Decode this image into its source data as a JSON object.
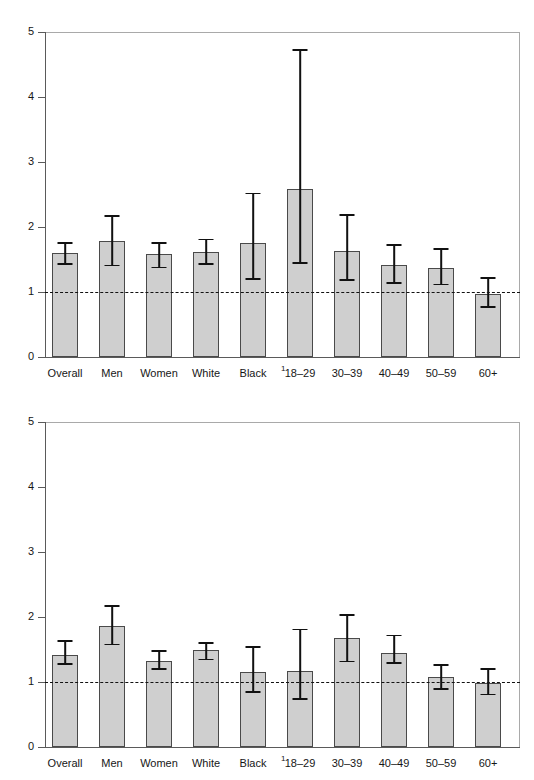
{
  "chart_data": [
    {
      "id": "top",
      "type": "bar",
      "title": "",
      "xlabel": "",
      "ylabel": "",
      "ylim": [
        0,
        5
      ],
      "yticks": [
        "0",
        "1",
        "2",
        "3",
        "4",
        "5"
      ],
      "grid": false,
      "legend": "none",
      "reference_line": 1,
      "error_bars": true,
      "footnote_marker": "1",
      "footnote_after_category": "Black",
      "categories": [
        "Overall",
        "Men",
        "Women",
        "White",
        "Black",
        "18–29",
        "30–39",
        "40–49",
        "50–59",
        "60+"
      ],
      "values": [
        1.6,
        1.78,
        1.58,
        1.62,
        1.76,
        2.58,
        1.63,
        1.41,
        1.37,
        0.97
      ],
      "ci_low": [
        1.45,
        1.42,
        1.39,
        1.45,
        1.21,
        1.46,
        1.2,
        1.15,
        1.13,
        0.78
      ],
      "ci_high": [
        1.77,
        2.18,
        1.77,
        1.82,
        2.53,
        4.74,
        2.2,
        1.74,
        1.68,
        1.23
      ]
    },
    {
      "id": "bottom",
      "type": "bar",
      "title": "",
      "xlabel": "",
      "ylabel": "",
      "ylim": [
        0,
        5
      ],
      "yticks": [
        "0",
        "1",
        "2",
        "3",
        "4",
        "5"
      ],
      "grid": false,
      "legend": "none",
      "reference_line": 1,
      "error_bars": true,
      "footnote_marker": "1",
      "footnote_after_category": "Black",
      "categories": [
        "Overall",
        "Men",
        "Women",
        "White",
        "Black",
        "18–29",
        "30–39",
        "40–49",
        "50–59",
        "60+"
      ],
      "values": [
        1.41,
        1.86,
        1.33,
        1.49,
        1.16,
        1.17,
        1.68,
        1.45,
        1.08,
        0.98
      ],
      "ci_low": [
        1.29,
        1.59,
        1.21,
        1.36,
        0.86,
        0.75,
        1.33,
        1.31,
        0.91,
        0.82
      ],
      "ci_high": [
        1.65,
        2.18,
        1.49,
        1.61,
        1.55,
        1.82,
        2.04,
        1.73,
        1.28,
        1.21
      ]
    }
  ],
  "colors": {
    "bar_fill": "#cfcfcf",
    "bar_stroke": "#4a4a4a",
    "axis": "#5a5a5a",
    "reference_line": "#111111",
    "text": "#161616"
  }
}
